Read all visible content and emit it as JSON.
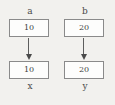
{
  "diagram": {
    "type": "variable-assignment-diagram",
    "background_color": "#f2f1ee",
    "box_border_color": "#8a8a8a",
    "box_fill_color": "#fdfdfc",
    "arrow_color": "#4a4a4a",
    "text_color": "#3d3d3d",
    "columns": [
      {
        "source": {
          "name": "a",
          "value": "10"
        },
        "arrow": {
          "direction": "down",
          "icon": "arrow-down-icon"
        },
        "target": {
          "name": "x",
          "value": "10"
        }
      },
      {
        "source": {
          "name": "b",
          "value": "20"
        },
        "arrow": {
          "direction": "down",
          "icon": "arrow-down-icon"
        },
        "target": {
          "name": "y",
          "value": "20"
        }
      }
    ]
  }
}
